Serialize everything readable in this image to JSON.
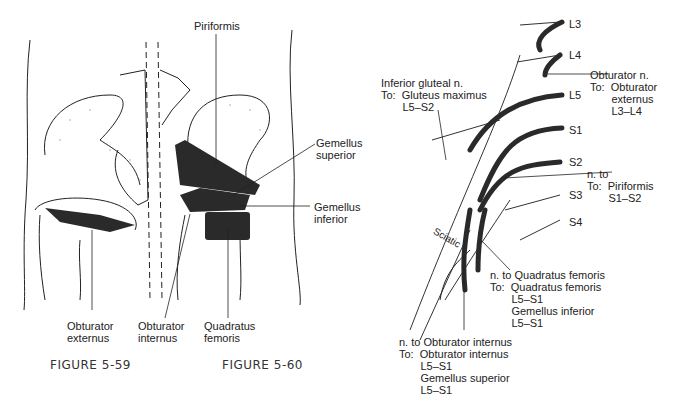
{
  "left_figure": {
    "labels": {
      "piriformis": "Piriformis",
      "gemellus_superior": "Gemellus\nsuperior",
      "gemellus_inferior": "Gemellus\ninferior",
      "obturator_externus": "Obturator\nexternus",
      "obturator_internus": "Obturator\ninternus",
      "quadratus_femoris": "Quadratus\nfemoris"
    },
    "captions": {
      "fig59": "FIGURE 5-59",
      "fig60": "FIGURE 5-60"
    }
  },
  "right_figure": {
    "roots": [
      "L3",
      "L4",
      "L5",
      "S1",
      "S2",
      "S3",
      "S4"
    ],
    "sciatic_label": "Sciatic",
    "annotations": {
      "obturator_n": "Obturator n.\nTo:  Obturator\n       externus\n       L3–L4",
      "inferior_gluteal": "Inferior gluteal n.\nTo:  Gluteus maximus\n       L5–S2",
      "n_to_piriformis": "n. to\nTo:  Piriformis\n       S1–S2",
      "n_to_quadratus": "n. to Quadratus femoris\nTo:  Quadratus femoris\n       L5–S1\n       Gemellus inferior\n       L5–S1",
      "n_to_obturator_internus": "n. to Obturator internus\nTo:  Obturator internus\n       L5–S1\n       Gemellus superior\n       L5–S1"
    }
  }
}
